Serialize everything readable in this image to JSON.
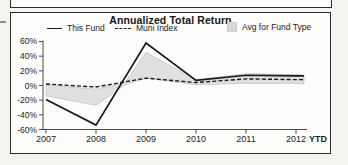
{
  "panel": {
    "title": "Annualized Total Return",
    "legend": [
      {
        "label": "This Fund",
        "marker": "solid-line-swatch"
      },
      {
        "label": "Muni Index",
        "marker": "dashed-line-swatch"
      },
      {
        "label": "Avg for Fund Type",
        "marker": "gray-band-swatch"
      }
    ]
  },
  "colors": {
    "line": "#1a1a1a",
    "band_fill": "#d9d9d9",
    "band_edge": "#bcbcbc",
    "axis": "#4a4a4a",
    "border": "#2b2b2b"
  },
  "chart_data": {
    "type": "line",
    "title": "Annualized Total Return",
    "categories": [
      "2007",
      "2008",
      "2009",
      "2010",
      "2011",
      "2012"
    ],
    "x_suffix": "YTD",
    "xlabel": "",
    "ylabel": "",
    "ylim": [
      -60,
      60
    ],
    "ytick_values": [
      60,
      40,
      20,
      0,
      -20,
      -40,
      -60
    ],
    "ytick_labels": [
      "60%",
      "40%",
      "20%",
      "0%",
      "-20%",
      "-40%",
      "-60%"
    ],
    "grid": false,
    "legend_position": "top",
    "series": [
      {
        "name": "This Fund",
        "style": "solid",
        "x": [
          0,
          1,
          2,
          3,
          4,
          5,
          5.16
        ],
        "values": [
          -19,
          -54,
          58,
          7,
          14,
          13,
          13
        ]
      },
      {
        "name": "Muni Index",
        "style": "dashed",
        "x": [
          0,
          1,
          2,
          3,
          4,
          5,
          5.16
        ],
        "values": [
          2,
          -2,
          10,
          4,
          9,
          8,
          8
        ]
      },
      {
        "name": "Avg for Fund Type",
        "style": "band",
        "x": [
          0,
          1,
          1.58,
          2,
          3,
          4,
          5,
          5.16
        ],
        "upper": [
          1,
          -5,
          4,
          45,
          8,
          16,
          15,
          14
        ],
        "lower": [
          -14,
          -27,
          1,
          10,
          1,
          3,
          3,
          2
        ]
      }
    ]
  }
}
